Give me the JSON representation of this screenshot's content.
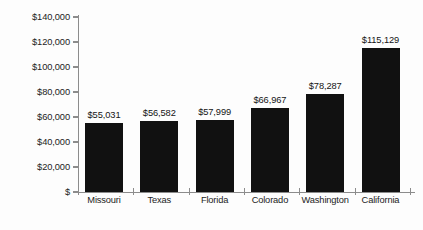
{
  "chart_data": {
    "type": "bar",
    "title": "",
    "subtitle": "",
    "xlabel": "",
    "ylabel": "",
    "categories": [
      "Missouri",
      "Texas",
      "Florida",
      "Colorado",
      "Washington",
      "California"
    ],
    "values": [
      55031,
      56582,
      57999,
      66967,
      78287,
      115129
    ],
    "value_labels": [
      "$55,031",
      "$56,582",
      "$57,999",
      "$66,967",
      "$78,287",
      "$115,129"
    ],
    "ylim": [
      0,
      140000
    ],
    "ytick_values": [
      0,
      20000,
      40000,
      60000,
      80000,
      100000,
      120000,
      140000
    ],
    "ytick_labels": [
      "$",
      "$20,000",
      "$40,000",
      "$60,000",
      "$80,000",
      "$100,000",
      "$120,000",
      "$140,000"
    ],
    "grid": false,
    "legend": null,
    "bar_color": "#111111",
    "axis_color": "#8c8c8c",
    "text_color": "#1c1c1c",
    "background_color": "#fdfdfd"
  }
}
